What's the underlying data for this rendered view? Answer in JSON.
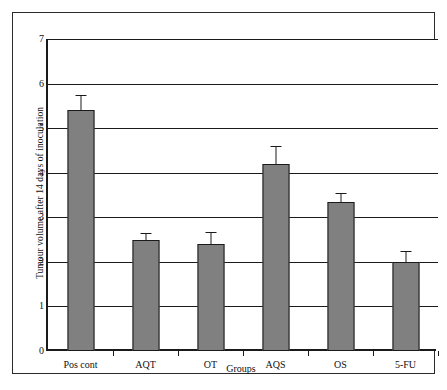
{
  "chart_data": {
    "type": "bar",
    "title": "",
    "xlabel": "Groups",
    "ylabel": "Tumour volume after 14 days of inoculation",
    "categories": [
      "Pos cont",
      "AQT",
      "OT",
      "AQS",
      "OS",
      "5-FU"
    ],
    "values": [
      5.4,
      2.5,
      2.4,
      4.2,
      3.35,
      2.0
    ],
    "errors": [
      0.35,
      0.15,
      0.28,
      0.4,
      0.2,
      0.25
    ],
    "ylim": [
      0,
      7
    ],
    "ytick_labels": [
      "0",
      "1",
      "2",
      "3",
      "4",
      "5",
      "6",
      "7"
    ],
    "ytick_values": [
      0,
      1,
      2,
      3,
      4,
      5,
      6,
      7
    ],
    "grid": true,
    "legend": "none",
    "series": [
      {
        "name": "Tumour volume",
        "values": [
          5.4,
          2.5,
          2.4,
          4.2,
          3.35,
          2.0
        ],
        "errors": [
          0.35,
          0.15,
          0.28,
          0.4,
          0.2,
          0.25
        ]
      }
    ],
    "colors": {
      "bar_fill": "#808080",
      "bar_stroke": "#1a1a1a",
      "gridline": "#1a1a1a",
      "axis": "#1a1a1a",
      "background": "#ffffff",
      "frame": "#2b2b2b",
      "text": "#111111"
    }
  }
}
